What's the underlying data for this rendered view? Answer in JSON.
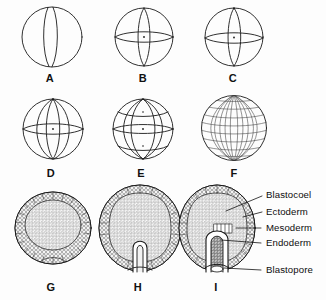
{
  "figure": {
    "background_color": "#fdfdfd",
    "ink_color": "#1a1a1a",
    "width": 326,
    "height": 300
  },
  "panels": [
    {
      "letter": "A",
      "stage_name": "two-cell stage",
      "x": 50,
      "y": 72
    },
    {
      "letter": "B",
      "stage_name": "four-cell stage",
      "x": 143,
      "y": 72
    },
    {
      "letter": "C",
      "stage_name": "four-cell stage polar view",
      "x": 233,
      "y": 72
    },
    {
      "letter": "D",
      "stage_name": "eight-cell stage",
      "x": 50,
      "y": 167
    },
    {
      "letter": "E",
      "stage_name": "sixteen-cell morula",
      "x": 139,
      "y": 167
    },
    {
      "letter": "F",
      "stage_name": "blastula",
      "x": 232,
      "y": 167
    },
    {
      "letter": "G",
      "stage_name": "blastula section",
      "x": 50,
      "y": 281
    },
    {
      "letter": "H",
      "stage_name": "early gastrula section",
      "x": 138,
      "y": 281
    },
    {
      "letter": "I",
      "stage_name": "late gastrula section",
      "x": 215,
      "y": 281
    }
  ],
  "callouts": [
    {
      "label": "Blastocoel",
      "x": 268,
      "y": 190,
      "leader": {
        "x1": 262,
        "y1": 196,
        "x2": 226,
        "y2": 211
      }
    },
    {
      "label": "Ectoderm",
      "x": 268,
      "y": 208,
      "leader": {
        "x1": 262,
        "y1": 213,
        "x2": 241,
        "y2": 216
      }
    },
    {
      "label": "Mesoderm",
      "x": 268,
      "y": 225,
      "leader": {
        "x1": 259,
        "y1": 229,
        "x2": 238,
        "y2": 229
      }
    },
    {
      "label": "Endoderm",
      "x": 268,
      "y": 240,
      "leader": {
        "x1": 259,
        "y1": 244,
        "x2": 219,
        "y2": 243
      }
    },
    {
      "label": "Blastopore",
      "x": 268,
      "y": 268,
      "leader": {
        "x1": 259,
        "y1": 271,
        "x2": 224,
        "y2": 268
      }
    }
  ]
}
